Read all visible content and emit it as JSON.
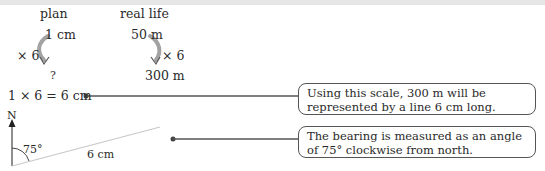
{
  "headers": {
    "plan": "plan",
    "real_life": "real life"
  },
  "plan_column": {
    "top": "1 cm",
    "multiplier": "× 6",
    "bottom": "?"
  },
  "real_column": {
    "top": "50 m",
    "multiplier": "× 6",
    "bottom": "300 m"
  },
  "calculation": "1 × 6 = 6 cm",
  "bearing_diagram": {
    "north_label": "N",
    "angle_label": "75°",
    "length_label": "6 cm"
  },
  "callouts": [
    {
      "text": "Using this scale, 300 m will be represented by a line 6 cm long."
    },
    {
      "text": "The bearing is measured as an angle of 75° clockwise from north."
    }
  ],
  "colors": {
    "text": "#2a2a2a",
    "line": "#555555",
    "bearing_line": "#c8c8c8",
    "top_band": "#e6e6e6"
  }
}
